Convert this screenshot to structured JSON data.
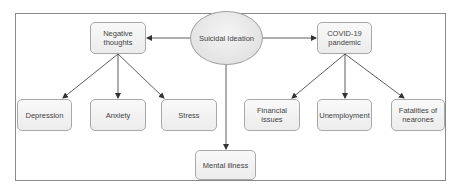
{
  "diagram": {
    "central": {
      "label": "Suicidal Ideation",
      "shape": "ellipse"
    },
    "branches": {
      "left": {
        "label": "Negative thoughts",
        "children": [
          "Depression",
          "Anxiety",
          "Stress"
        ]
      },
      "right": {
        "label": "COVID-19 pandemic",
        "children": [
          "Financial issues",
          "Unemployment",
          "Fatalities of nearones"
        ]
      },
      "down": {
        "label": "Mental illness"
      }
    },
    "edges": [
      {
        "from": "Suicidal Ideation",
        "to": "Negative thoughts"
      },
      {
        "from": "Suicidal Ideation",
        "to": "COVID-19 pandemic"
      },
      {
        "from": "Suicidal Ideation",
        "to": "Mental illness"
      },
      {
        "from": "Negative thoughts",
        "to": "Depression"
      },
      {
        "from": "Negative thoughts",
        "to": "Anxiety"
      },
      {
        "from": "Negative thoughts",
        "to": "Stress"
      },
      {
        "from": "COVID-19 pandemic",
        "to": "Financial issues"
      },
      {
        "from": "COVID-19 pandemic",
        "to": "Unemployment"
      },
      {
        "from": "COVID-19 pandemic",
        "to": "Fatalities of nearones"
      }
    ],
    "colors": {
      "border": "#8a8a8a",
      "node_fill": "#f2f2f2",
      "node_stroke": "#a8a8a8",
      "edge": "#333333",
      "text": "#444444"
    }
  }
}
